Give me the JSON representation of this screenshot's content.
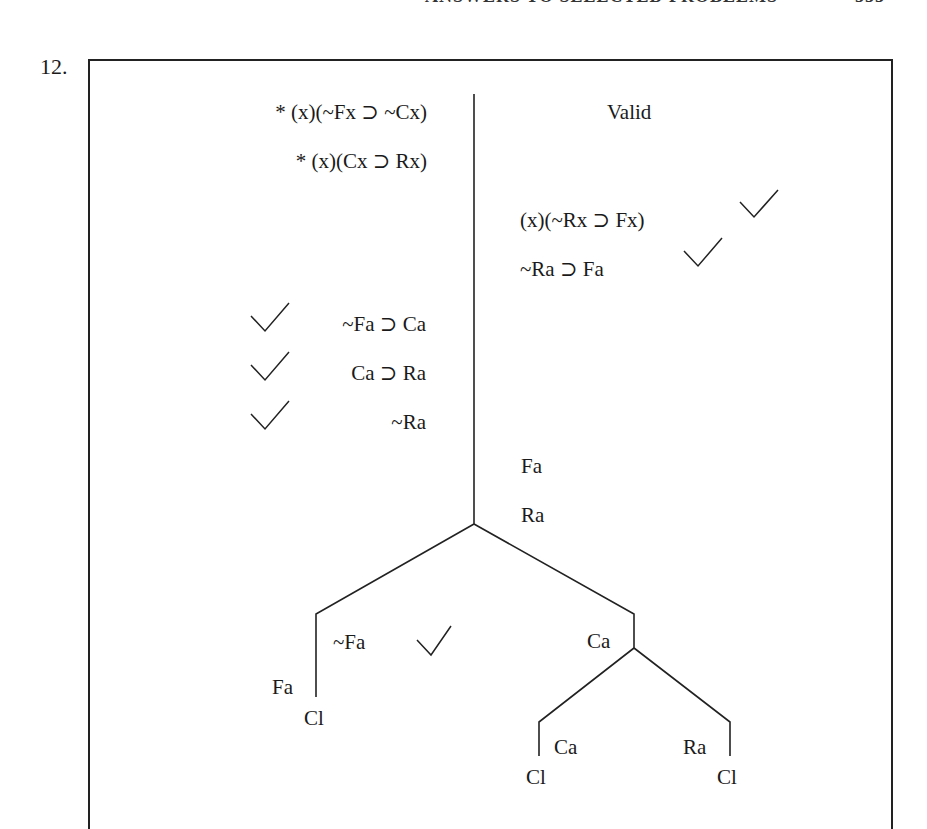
{
  "page_header": {
    "running_title": "ANSWERS TO SELECTED PROBLEMS",
    "page_number": "555"
  },
  "problem": {
    "number": "12.",
    "verdict": "Valid",
    "left_column": {
      "premises": [
        "* (x)(~Fx ⊃ ~Cx)",
        "* (x)(Cx ⊃ Rx)"
      ],
      "instances": [
        {
          "text": "~Fa ⊃ Ca",
          "checked": true
        },
        {
          "text": "Ca ⊃ Ra",
          "checked": true
        },
        {
          "text": "~Ra",
          "checked": true
        }
      ]
    },
    "right_column": {
      "conclusion": {
        "text": "(x)(~Rx ⊃ Fx)",
        "checked": true
      },
      "instance": {
        "text": "~Ra ⊃ Fa",
        "checked": true
      },
      "atoms": [
        "Fa",
        "Ra"
      ]
    },
    "tree": {
      "left_branch": {
        "right_label": "~Fa",
        "right_checked": true,
        "left_label": "Fa",
        "closure": "Cl"
      },
      "right_branch": {
        "label": "Ca",
        "sub_left": {
          "label": "Ca",
          "closure": "Cl"
        },
        "sub_right": {
          "label": "Ra",
          "closure": "Cl"
        }
      }
    },
    "check_glyph": "✓",
    "line_color": "#222222"
  }
}
